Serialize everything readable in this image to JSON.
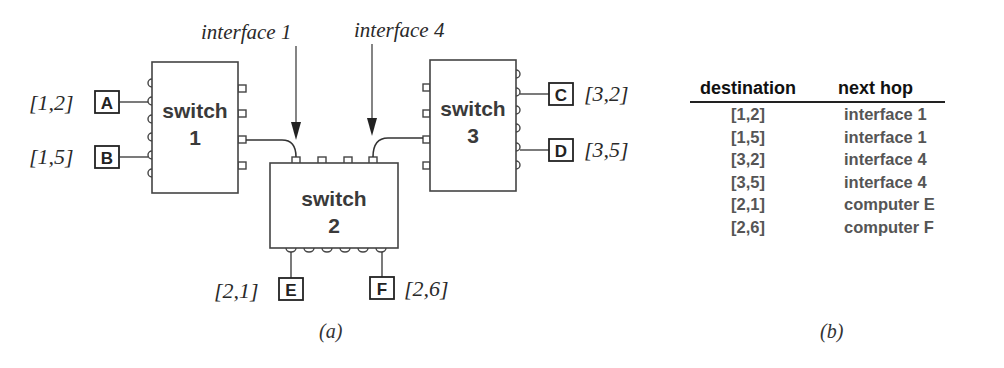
{
  "diagram": {
    "caption": "(a)",
    "switches": [
      {
        "id": "switch-1",
        "label": "switch",
        "number": "1"
      },
      {
        "id": "switch-2",
        "label": "switch",
        "number": "2"
      },
      {
        "id": "switch-3",
        "label": "switch",
        "number": "3"
      }
    ],
    "interfaces": [
      {
        "label": "interface 1"
      },
      {
        "label": "interface 4"
      }
    ],
    "hosts": [
      {
        "name": "A",
        "address": "[1,2]"
      },
      {
        "name": "B",
        "address": "[1,5]"
      },
      {
        "name": "C",
        "address": "[3,2]"
      },
      {
        "name": "D",
        "address": "[3,5]"
      },
      {
        "name": "E",
        "address": "[2,1]"
      },
      {
        "name": "F",
        "address": "[2,6]"
      }
    ]
  },
  "table": {
    "caption": "(b)",
    "headers": [
      "destination",
      "next hop"
    ],
    "rows": [
      {
        "destination": "[1,2]",
        "next_hop": "interface 1"
      },
      {
        "destination": "[1,5]",
        "next_hop": "interface 1"
      },
      {
        "destination": "[3,2]",
        "next_hop": "interface 4"
      },
      {
        "destination": "[3,5]",
        "next_hop": "interface 4"
      },
      {
        "destination": "[2,1]",
        "next_hop": "computer E"
      },
      {
        "destination": "[2,6]",
        "next_hop": "computer F"
      }
    ]
  }
}
